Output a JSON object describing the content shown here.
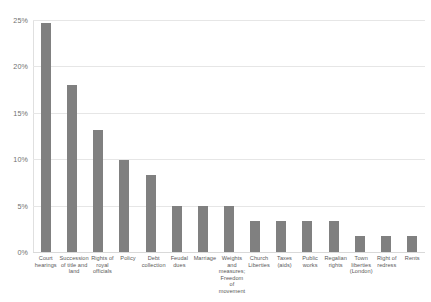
{
  "chart_data": {
    "type": "bar",
    "title": "",
    "subtitle": "",
    "xlabel": "",
    "ylabel": "",
    "ylim": [
      0,
      25
    ],
    "grid": true,
    "legend": false,
    "legend_position": "none",
    "orientation": "vertical",
    "bar_color": "#808080",
    "value_suffix": "%",
    "ytick_labels": [
      "0%",
      "5%",
      "10%",
      "15%",
      "20%",
      "25%"
    ],
    "ytick_values": [
      0,
      5,
      10,
      15,
      20,
      25
    ],
    "categories": [
      "Court hearings",
      "Succession of title and land",
      "Rights of royal officials",
      "Policy",
      "Debt collection",
      "Feudal dues",
      "Marriage",
      "Weights and measures; Freedom of movement",
      "Church Liberties",
      "Taxes (aids)",
      "Public works",
      "Regalian rights",
      "Town liberties (London)",
      "Right of redress",
      "Rents"
    ],
    "values": [
      24.7,
      18.0,
      13.1,
      9.9,
      8.3,
      5.0,
      5.0,
      5.0,
      3.3,
      3.3,
      3.3,
      3.3,
      1.7,
      1.7,
      1.7
    ]
  }
}
